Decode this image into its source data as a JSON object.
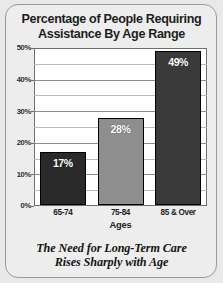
{
  "card": {
    "background_color": "#e9e9e9",
    "frame_color": "#9a9a9a"
  },
  "title": {
    "line1": "Percentage of People Requiring",
    "line2": "Assistance By Age Range"
  },
  "caption": {
    "line1": "The Need for Long-Term Care",
    "line2": "Rises Sharply with Age"
  },
  "chart_data": {
    "type": "bar",
    "title": "Percentage of People Requiring Assistance By Age Range",
    "subtitle": "The Need for Long-Term Care Rises Sharply with Age",
    "categories": [
      "65-74",
      "75-84",
      "85 & Over"
    ],
    "values": [
      17,
      28,
      49
    ],
    "data_labels": [
      "17%",
      "28%",
      "49%"
    ],
    "bar_colors": [
      "#2a2a2a",
      "#8e8e8e",
      "#3a3a3a"
    ],
    "xlabel": "Ages",
    "ylabel": "",
    "ylim": [
      0,
      50
    ],
    "ytick_labels": [
      "0%",
      "10%",
      "20%",
      "30%",
      "40%",
      "50%"
    ],
    "ytick_values": [
      0,
      10,
      20,
      30,
      40,
      50
    ],
    "minor_gridline_values": [
      5,
      15,
      25,
      35,
      45
    ],
    "grid": true,
    "legend": "none",
    "plot_background": "#ffffff",
    "units": "percent"
  }
}
